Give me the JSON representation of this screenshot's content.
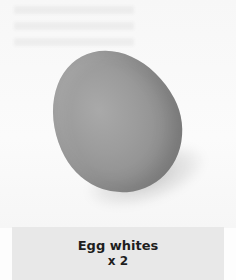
{
  "item": {
    "name": "Egg whites",
    "quantity": "x 2",
    "image": {
      "subject": "egg",
      "background_color": "#f8f8f8",
      "egg_color": "#979797"
    }
  },
  "caption": {
    "background_color": "#e8e8e8",
    "text_color": "#1e1e1e"
  }
}
